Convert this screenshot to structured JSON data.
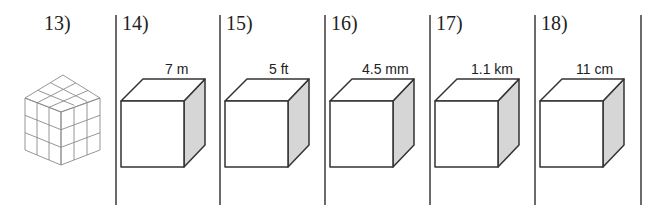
{
  "problems": [
    {
      "number": "13)",
      "figure": "unit-cube-3x3x3"
    },
    {
      "number": "14)",
      "side": "7 m"
    },
    {
      "number": "15)",
      "side": "5 ft"
    },
    {
      "number": "16)",
      "side": "4.5 mm"
    },
    {
      "number": "17)",
      "side": "1.1 km"
    },
    {
      "number": "18)",
      "side": "11 cm"
    }
  ],
  "colors": {
    "line": "#333333",
    "shade": "#d6d6d6",
    "divider": "#6b6b6b"
  }
}
